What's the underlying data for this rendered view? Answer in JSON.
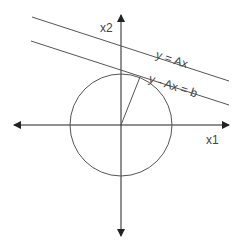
{
  "diagram": {
    "labels": {
      "x_axis": "x1",
      "y_axis": "x2",
      "line_upper": "y = Ax",
      "line_lower": "y - Ax = b"
    },
    "colors": {
      "stroke": "#555555",
      "axis": "#222222",
      "text": "#444444"
    },
    "elements": {
      "origin": [
        121,
        125
      ],
      "circle_radius": 51,
      "radius_endpoint": [
        140,
        77
      ]
    }
  }
}
